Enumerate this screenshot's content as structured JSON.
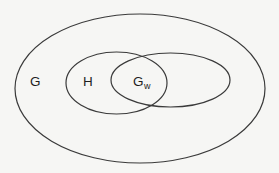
{
  "diagram": {
    "type": "venn",
    "sets": [
      {
        "id": "G",
        "label": "G",
        "description": "outer set containing H and G_w"
      },
      {
        "id": "H",
        "label": "H",
        "description": "subset of G, overlaps G_w"
      },
      {
        "id": "Gw",
        "label": "G",
        "subscript": "w",
        "description": "subset of G, overlaps H"
      }
    ],
    "relations": [
      {
        "type": "contains",
        "outer": "G",
        "inner": "H"
      },
      {
        "type": "contains",
        "outer": "G",
        "inner": "Gw"
      },
      {
        "type": "overlaps",
        "a": "H",
        "b": "Gw"
      }
    ],
    "colors": {
      "stroke": "#3a3a3a",
      "text": "#1e1e1e",
      "background": "#f6f6f4"
    }
  }
}
